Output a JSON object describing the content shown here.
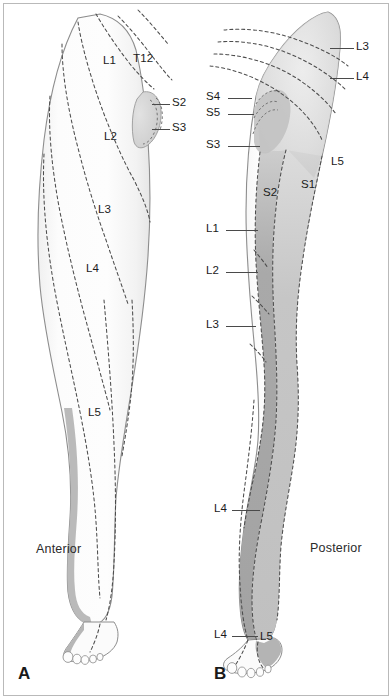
{
  "figure": {
    "panels": [
      {
        "letter": "A",
        "view_label": "Anterior",
        "labels": [
          {
            "name": "L1",
            "text": "L1"
          },
          {
            "name": "T12",
            "text": "T12"
          },
          {
            "name": "S2",
            "text": "S2"
          },
          {
            "name": "S3",
            "text": "S3"
          },
          {
            "name": "L2",
            "text": "L2"
          },
          {
            "name": "L3",
            "text": "L3"
          },
          {
            "name": "L4",
            "text": "L4"
          },
          {
            "name": "L5",
            "text": "L5"
          }
        ]
      },
      {
        "letter": "B",
        "view_label": "Posterior",
        "labels": [
          {
            "name": "L3-upper",
            "text": "L3"
          },
          {
            "name": "L4-upper",
            "text": "L4"
          },
          {
            "name": "S4",
            "text": "S4"
          },
          {
            "name": "S5",
            "text": "S5"
          },
          {
            "name": "S3",
            "text": "S3"
          },
          {
            "name": "L5",
            "text": "L5"
          },
          {
            "name": "S1",
            "text": "S1"
          },
          {
            "name": "S2",
            "text": "S2"
          },
          {
            "name": "L1",
            "text": "L1"
          },
          {
            "name": "L2",
            "text": "L2"
          },
          {
            "name": "L3-lower",
            "text": "L3"
          },
          {
            "name": "L4-leg",
            "text": "L4"
          },
          {
            "name": "L4-foot",
            "text": "L4"
          },
          {
            "name": "L5-foot",
            "text": "L5"
          }
        ]
      }
    ]
  },
  "panel_a": {
    "letter": "A",
    "view": "Anterior",
    "l1": "L1",
    "t12": "T12",
    "s2": "S2",
    "s3": "S3",
    "l2": "L2",
    "l3": "L3",
    "l4": "L4",
    "l5": "L5"
  },
  "panel_b": {
    "letter": "B",
    "view": "Posterior",
    "l3_upper": "L3",
    "l4_upper": "L4",
    "s4": "S4",
    "s5": "S5",
    "s3": "S3",
    "l5": "L5",
    "s1": "S1",
    "s2": "S2",
    "l1": "L1",
    "l2": "L2",
    "l3_lower": "L3",
    "l4_leg": "L4",
    "l4_foot": "L4",
    "l5_foot": "L5"
  },
  "colors": {
    "background": "#ffffff",
    "frame_border": "#b9b9b9",
    "skin_light": "#fbfbfb",
    "skin_outline": "#8d8d8d",
    "dermatome_dash": "#4d4d4d",
    "shade_very_light": "#f1f1f1",
    "shade_light": "#dedede",
    "shade_mid": "#c9c9c9",
    "shade_dark": "#ababab",
    "shade_darker": "#9b9b9b",
    "text": "#1b1b1b",
    "leader_line": "#4a4a4a"
  }
}
